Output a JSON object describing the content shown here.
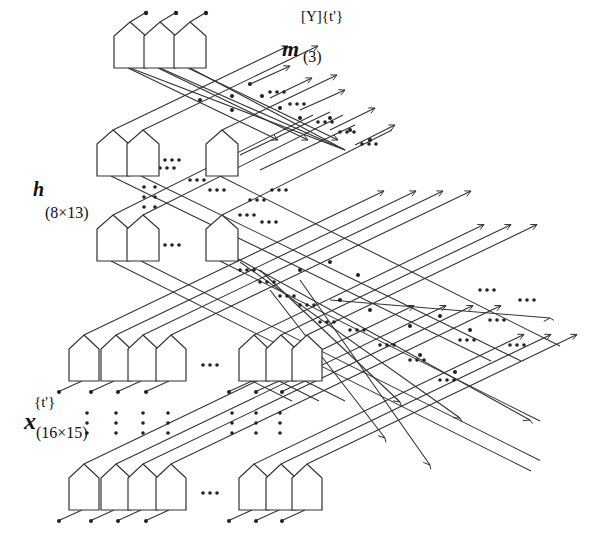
{
  "labels": {
    "m": {
      "symbol": "m",
      "superscript": "[Y]{t'}",
      "subscript": "(3)"
    },
    "h": {
      "symbol": "h",
      "subscript": "(8×13)"
    },
    "x": {
      "symbol": "x",
      "superscript": "{t'}",
      "subscript": "(16×15)"
    }
  },
  "layers": [
    {
      "name": "output-layer-m",
      "units_visible": 3,
      "ellipsis": false
    },
    {
      "name": "hidden-layer-h-top",
      "units_visible": 3,
      "ellipsis": true,
      "ellipsis_text": "• • •"
    },
    {
      "name": "hidden-layer-h-bottom",
      "units_visible": 3,
      "ellipsis": true,
      "ellipsis_text": "• • •"
    },
    {
      "name": "input-layer-x-top",
      "units_visible": 7,
      "ellipsis": true,
      "ellipsis_text": "• • •"
    },
    {
      "name": "input-layer-x-bottom",
      "units_visible": 7,
      "ellipsis": true,
      "ellipsis_text": "• • •"
    }
  ],
  "colors": {
    "stroke": "#333333",
    "dot": "#222222",
    "background": "#ffffff"
  }
}
